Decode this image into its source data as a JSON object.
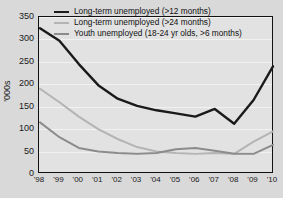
{
  "chart_data": {
    "type": "line",
    "title": "",
    "xlabel": "",
    "ylabel": "'000s",
    "ylim": [
      0,
      350
    ],
    "ytick_values": [
      0,
      50,
      100,
      150,
      200,
      250,
      300,
      350
    ],
    "ytick_labels": [
      "0",
      "50",
      "100",
      "150",
      "200",
      "250",
      "300",
      "350"
    ],
    "grid": true,
    "legend_position": "top-center-inside",
    "categories": [
      "'98",
      "'99",
      "'00",
      "'01",
      "'02",
      "'03",
      "'04",
      "'05",
      "'06",
      "'07",
      "'08",
      "'09",
      "'10"
    ],
    "x_values": [
      1998,
      1999,
      2000,
      2001,
      2002,
      2003,
      2004,
      2005,
      2006,
      2007,
      2008,
      2009,
      2010
    ],
    "series": [
      {
        "name": "Long-term unemployed (>12 months)",
        "color": "#1a1a1a",
        "width": 2.4,
        "values": [
          325,
          297,
          245,
          198,
          168,
          152,
          142,
          135,
          128,
          145,
          112,
          165,
          240
        ]
      },
      {
        "name": "Long-term unemployed (>24 months)",
        "color": "#b4b4b4",
        "width": 2.0,
        "values": [
          190,
          160,
          128,
          100,
          78,
          60,
          50,
          47,
          45,
          47,
          45,
          72,
          95
        ]
      },
      {
        "name": "Youth unemployed (18-24 yr olds, >6 months)",
        "color": "#8c8c8c",
        "width": 2.0,
        "values": [
          115,
          82,
          58,
          50,
          47,
          45,
          47,
          55,
          58,
          52,
          45,
          45,
          65
        ]
      }
    ]
  }
}
